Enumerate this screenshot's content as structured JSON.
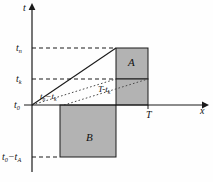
{
  "figure": {
    "type": "coordinate-diagram",
    "background": "#fefefe",
    "shade_fill": "#b3b3b3",
    "stroke": "#1a1a1a",
    "axes": {
      "t_axis_label": "t",
      "x_axis_label": "x"
    },
    "t_ticks": [
      {
        "id": "tn",
        "base": "t",
        "sub": "n",
        "text": "tₙ",
        "y": 48
      },
      {
        "id": "tk",
        "base": "t",
        "sub": "k",
        "text": "tₖ",
        "y": 79
      },
      {
        "id": "t0",
        "base": "t",
        "sub": "0",
        "text": "t₀",
        "y": 105
      },
      {
        "id": "t0ta",
        "base": "t₀−t",
        "sub": "A",
        "text": "t₀−tₐ",
        "y": 157
      }
    ],
    "x_ticks": [
      {
        "id": "T",
        "text": "T",
        "x": 148
      }
    ],
    "regions": [
      {
        "id": "A",
        "label": "A",
        "x": 116,
        "y": 48,
        "w": 32,
        "h": 31
      },
      {
        "id": "Tminustk",
        "label": "T-tₖ",
        "x": 116,
        "y": 79,
        "w": 32,
        "h": 26
      },
      {
        "id": "B",
        "label": "B",
        "x": 60,
        "y": 105,
        "w": 56,
        "h": 52
      }
    ],
    "segment_labels": [
      {
        "id": "diagonal",
        "text": "tₙ−tₖ"
      },
      {
        "id": "interval",
        "text": "T-tₖ"
      }
    ],
    "labels": {
      "t_axis": "t",
      "x_axis": "x",
      "tn_base": "t",
      "tn_sub": "n",
      "tk_base": "t",
      "tk_sub": "k",
      "t0_base": "t",
      "t0_sub": "0",
      "tota_base": "t",
      "tota_sub0": "0",
      "tota_mid": "−t",
      "tota_subA": "A",
      "T": "T",
      "region_A": "A",
      "region_B": "B",
      "diag_base1": "t",
      "diag_sub1": "n",
      "diag_mid": "−",
      "diag_base2": "t",
      "diag_sub2": "k",
      "int_base": "T-",
      "int_t": "t",
      "int_sub": "k"
    }
  }
}
